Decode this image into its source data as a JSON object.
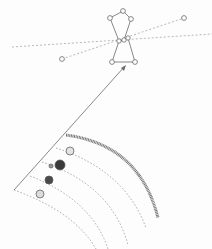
{
  "diagram": {
    "colors": {
      "background": "#fdfdfd",
      "line": "#6a6a6a",
      "dashed": "#9a9a9a",
      "planet_dark": "#3a3a3a",
      "planet_light": "#d8d8d8",
      "belt": "#777777"
    },
    "constellation": {
      "stars": [
        {
          "x": 123,
          "y": 11
        },
        {
          "x": 110,
          "y": 18
        },
        {
          "x": 131,
          "y": 19
        },
        {
          "x": 119,
          "y": 41
        },
        {
          "x": 124,
          "y": 40
        },
        {
          "x": 128,
          "y": 38
        },
        {
          "x": 112,
          "y": 62
        },
        {
          "x": 135,
          "y": 62
        },
        {
          "x": 62,
          "y": 59
        },
        {
          "x": 184,
          "y": 18
        }
      ]
    },
    "planets": [
      {
        "x": 70,
        "y": 151,
        "r": 4,
        "style": "light"
      },
      {
        "x": 60,
        "y": 165,
        "r": 5,
        "style": "dark"
      },
      {
        "x": 51,
        "y": 166,
        "r": 2,
        "style": "medium"
      },
      {
        "x": 49,
        "y": 180,
        "r": 4,
        "style": "dark"
      },
      {
        "x": 40,
        "y": 194,
        "r": 4,
        "style": "light"
      }
    ]
  }
}
